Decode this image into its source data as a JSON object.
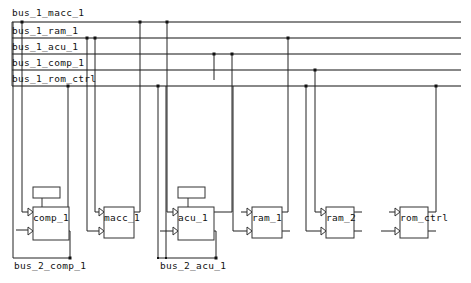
{
  "diagram": {
    "type": "schematic",
    "buses": [
      {
        "name": "bus_1_macc_1",
        "y": 22,
        "label_x": 12,
        "label_y": 7
      },
      {
        "name": "bus_1_ram_1",
        "y": 38,
        "label_x": 12,
        "label_y": 26
      },
      {
        "name": "bus_1_acu_1",
        "y": 54,
        "label_x": 12,
        "label_y": 42
      },
      {
        "name": "bus_1_comp_1",
        "y": 70,
        "label_x": 12,
        "label_y": 58
      },
      {
        "name": "bus_1_rom_ctrl",
        "y": 86,
        "label_x": 12,
        "label_y": 74
      }
    ],
    "bus_x_start": 12,
    "bus_x_end": 461,
    "components": [
      {
        "name": "comp_1",
        "x": 33,
        "y": 207,
        "w": 36,
        "h": 32,
        "has_register": true
      },
      {
        "name": "macc_1",
        "x": 104,
        "y": 207,
        "w": 30,
        "h": 30,
        "has_register": false
      },
      {
        "name": "acu_1",
        "x": 178,
        "y": 207,
        "w": 36,
        "h": 32,
        "has_register": true
      },
      {
        "name": "ram_1",
        "x": 252,
        "y": 207,
        "w": 30,
        "h": 30,
        "has_register": false
      },
      {
        "name": "ram_2",
        "x": 326,
        "y": 207,
        "w": 28,
        "h": 30,
        "has_register": false
      },
      {
        "name": "rom_ctrl",
        "x": 400,
        "y": 207,
        "w": 28,
        "h": 30,
        "has_register": false
      }
    ],
    "local_buses": [
      {
        "name": "bus_2_comp_1",
        "label_x": 14,
        "label_y": 261
      },
      {
        "name": "bus_2_acu_1",
        "label_x": 160,
        "label_y": 261
      }
    ]
  }
}
